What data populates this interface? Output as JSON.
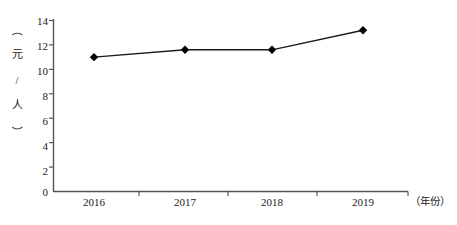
{
  "chart_data": {
    "type": "line",
    "title": "",
    "subtitle": "",
    "xlabel": "（年份）",
    "ylabel": "（元/人）",
    "categories": [
      "2016",
      "2017",
      "2018",
      "2019"
    ],
    "values": [
      11.0,
      11.6,
      11.6,
      13.2
    ],
    "series": [
      {
        "name": "",
        "values": [
          11.0,
          11.6,
          11.6,
          13.2
        ]
      }
    ],
    "ylim": [
      0,
      14
    ],
    "ytick_step": 2,
    "yticks": [
      "14",
      "12",
      "10",
      "8",
      "6",
      "4",
      "2",
      "0"
    ],
    "ytick_values": [
      14,
      12,
      10,
      8,
      6,
      4,
      2,
      0
    ],
    "xticks": [
      "2016",
      "2017",
      "2018",
      "2019"
    ],
    "grid": false,
    "legend": false,
    "legend_position": "none",
    "marker": "diamond",
    "line_color": "#1a1a1a",
    "marker_color": "#000000",
    "axis_color": "#555555",
    "background_color": "#ffffff"
  },
  "axis": {
    "y_unit_chars": [
      "（",
      "元",
      "/",
      "人",
      "）"
    ],
    "x_unit_label": "（年份）"
  }
}
